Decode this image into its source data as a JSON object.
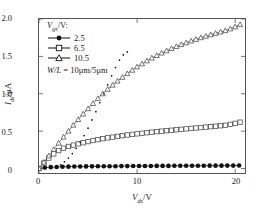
{
  "chart_data": {
    "type": "line",
    "title": "",
    "xlabel": "Vds/V",
    "ylabel": "Ids/uA",
    "xlim": [
      0,
      21
    ],
    "ylim": [
      -0.06,
      2.0
    ],
    "xticks": [
      0,
      10,
      20
    ],
    "xticklabels": [
      "0",
      "10",
      "20"
    ],
    "yticks": [
      0,
      0.5,
      1.0,
      1.5,
      2.0
    ],
    "yticklabels": [
      "0",
      "0.5",
      "1.0",
      "1.5",
      "2.0"
    ],
    "grid": false,
    "legend_position": "upper-left",
    "legend_title": "Vgs/V:",
    "annotation": "W/L = 10um/5um",
    "series": [
      {
        "name": "2.5",
        "marker": "filled-circle",
        "color": "#111111",
        "x": [
          0.0,
          0.6,
          1.2,
          1.8,
          2.4,
          3.0,
          3.6,
          4.2,
          4.8,
          5.4,
          6.0,
          6.6,
          7.2,
          7.8,
          8.4,
          9.0,
          9.6,
          10.2,
          10.8,
          11.4,
          12.0,
          12.6,
          13.2,
          13.8,
          14.4,
          15.0,
          15.6,
          16.2,
          16.8,
          17.4,
          18.0,
          18.6,
          19.2,
          19.8,
          20.4
        ],
        "y": [
          0.0,
          0.012,
          0.018,
          0.021,
          0.023,
          0.025,
          0.026,
          0.027,
          0.028,
          0.029,
          0.03,
          0.03,
          0.031,
          0.031,
          0.032,
          0.032,
          0.033,
          0.033,
          0.034,
          0.034,
          0.035,
          0.035,
          0.035,
          0.036,
          0.036,
          0.036,
          0.037,
          0.037,
          0.037,
          0.038,
          0.038,
          0.038,
          0.039,
          0.039,
          0.04
        ]
      },
      {
        "name": "6.5",
        "marker": "open-square",
        "color": "#4a4a4a",
        "x": [
          0.0,
          0.5,
          1.0,
          1.5,
          2.0,
          2.5,
          3.0,
          3.5,
          4.0,
          4.5,
          5.0,
          5.5,
          6.0,
          6.5,
          7.0,
          7.5,
          8.0,
          8.5,
          9.0,
          9.5,
          10.0,
          10.5,
          11.0,
          11.5,
          12.0,
          12.5,
          13.0,
          13.5,
          14.0,
          14.5,
          15.0,
          15.5,
          16.0,
          16.5,
          17.0,
          17.5,
          18.0,
          18.5,
          19.0,
          19.5,
          20.0,
          20.5
        ],
        "y": [
          0.0,
          0.075,
          0.14,
          0.196,
          0.24,
          0.272,
          0.295,
          0.313,
          0.33,
          0.345,
          0.36,
          0.374,
          0.387,
          0.399,
          0.41,
          0.42,
          0.43,
          0.439,
          0.448,
          0.456,
          0.464,
          0.472,
          0.479,
          0.486,
          0.493,
          0.5,
          0.506,
          0.512,
          0.518,
          0.524,
          0.53,
          0.536,
          0.542,
          0.548,
          0.554,
          0.56,
          0.566,
          0.572,
          0.578,
          0.59,
          0.605,
          0.62
        ]
      },
      {
        "name": "10.5",
        "marker": "open-triangle",
        "color": "#4a4a4a",
        "x": [
          0.0,
          0.5,
          1.0,
          1.5,
          2.0,
          2.5,
          3.0,
          3.5,
          4.0,
          4.5,
          5.0,
          5.5,
          6.0,
          6.5,
          7.0,
          7.5,
          8.0,
          8.5,
          9.0,
          9.5,
          10.0,
          10.5,
          11.0,
          11.5,
          12.0,
          12.5,
          13.0,
          13.5,
          14.0,
          14.5,
          15.0,
          15.5,
          16.0,
          16.5,
          17.0,
          17.5,
          18.0,
          18.5,
          19.0,
          19.5,
          20.0,
          20.5
        ],
        "y": [
          0.0,
          0.085,
          0.17,
          0.255,
          0.34,
          0.42,
          0.5,
          0.58,
          0.655,
          0.73,
          0.8,
          0.87,
          0.935,
          1.0,
          1.06,
          1.115,
          1.17,
          1.22,
          1.27,
          1.315,
          1.36,
          1.4,
          1.44,
          1.478,
          1.512,
          1.545,
          1.575,
          1.605,
          1.632,
          1.658,
          1.682,
          1.706,
          1.728,
          1.75,
          1.77,
          1.79,
          1.808,
          1.826,
          1.845,
          1.868,
          1.895,
          1.925
        ]
      },
      {
        "name": "saturation-locus",
        "marker": "dotted",
        "color": "#111111",
        "x": [
          1.8,
          2.2,
          2.6,
          3.0,
          3.4,
          3.8,
          4.2,
          4.6,
          5.0,
          5.4,
          5.8,
          6.2,
          6.6,
          7.0,
          7.4,
          7.8,
          8.2,
          8.6,
          9.0
        ],
        "y": [
          0.02,
          0.05,
          0.09,
          0.14,
          0.2,
          0.27,
          0.35,
          0.44,
          0.54,
          0.65,
          0.76,
          0.88,
          1.0,
          1.12,
          1.24,
          1.35,
          1.45,
          1.52,
          1.56
        ]
      }
    ]
  },
  "axis": {
    "ylabel_sym": "I",
    "ylabel_sub": "ds",
    "ylabel_unit": "/μA",
    "xlabel_sym": "V",
    "xlabel_sub": "ds",
    "xlabel_unit": "/V"
  },
  "legend": {
    "title_sym": "V",
    "title_sub": "gs",
    "title_unit": "/V:",
    "entries": [
      {
        "label": "2.5",
        "marker": "filled-circle"
      },
      {
        "label": "6.5",
        "marker": "open-square"
      },
      {
        "label": "10.5",
        "marker": "open-triangle"
      }
    ],
    "note_wl": "W/L",
    "note_rest": " = 10μm/5μm"
  }
}
